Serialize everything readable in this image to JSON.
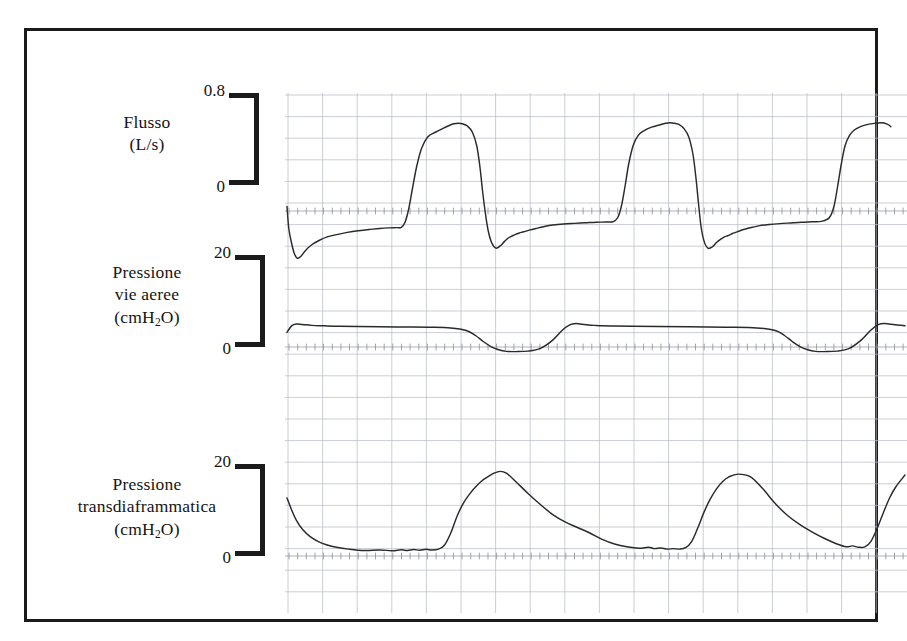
{
  "figure": {
    "border_color": "#1b1b1b",
    "grid_color": "#b9bdc9",
    "trace_color": "#2a2a2a"
  },
  "panels": [
    {
      "id": "flow",
      "label_lines": [
        "Flusso",
        "(L/s)"
      ],
      "unit": "L/s",
      "scale_top": "0.8",
      "scale_bottom": "0"
    },
    {
      "id": "airway-pressure",
      "label_lines": [
        "Pressione",
        "vie aeree",
        "(cmH2O)"
      ],
      "unit": "cmH2O",
      "scale_top": "20",
      "scale_bottom": "0"
    },
    {
      "id": "transdiaphragmatic-pressure",
      "label_lines": [
        "Pressione",
        "transdiaframmatica",
        "(cmH2O)"
      ],
      "unit": "cmH2O",
      "scale_top": "20",
      "scale_bottom": "0"
    }
  ],
  "chart_data": {
    "type": "line",
    "title": "",
    "xlabel": "",
    "grid": true,
    "legend": false,
    "n_breaths": 4,
    "panels": [
      {
        "name": "Flusso",
        "ylabel": "Flusso (L/s)",
        "yticks": [
          0,
          0.8
        ],
        "ylim": [
          -0.55,
          1.0
        ],
        "zero_y": 0,
        "series": [
          {
            "name": "Flusso",
            "x": [
              0,
              0.6,
              1.6,
              2.4,
              3.4,
              4.6,
              6.0,
              8.0,
              10.5,
              13.0,
              16.0,
              19.5,
              23.0,
              26.5,
              30.0,
              33.0,
              35.5,
              37.0,
              38.2,
              39.4,
              40.6,
              42.0,
              43.6,
              45.6,
              48.0,
              50.5,
              52.5,
              54.0,
              55.4,
              56.8,
              58.4,
              60.0,
              61.4,
              62.4,
              63.2,
              64.0,
              65.0,
              66.2,
              67.6,
              69.0,
              70.4,
              71.6,
              72.6,
              73.4,
              74.2,
              75.2,
              76.6,
              78.4,
              80.6,
              83.0,
              86.0,
              89.5,
              93.0,
              96.5,
              100.0,
              103.0,
              105.5,
              107.0,
              108.2,
              109.4,
              110.6,
              112.0,
              113.6,
              115.6,
              118.0,
              120.5,
              122.5,
              124.0,
              125.4,
              126.8,
              128.4,
              130.0,
              131.4,
              132.4,
              133.2,
              134.0,
              135.0,
              136.2,
              137.6,
              139.0,
              140.4,
              141.6,
              142.6,
              143.4,
              144.2,
              145.2,
              146.6,
              148.4,
              150.6,
              153.0,
              156.0,
              159.5,
              163.0,
              166.5,
              170.0,
              173.0,
              175.5,
              177.0,
              178.2,
              179.4,
              180.6,
              182.0,
              183.6,
              185.6,
              188.0,
              190.5,
              192.5,
              194.0,
              195.4,
              196.8,
              198.4,
              200.0
            ],
            "y": [
              0.04,
              -0.16,
              -0.3,
              -0.38,
              -0.42,
              -0.4,
              -0.35,
              -0.3,
              -0.26,
              -0.23,
              -0.21,
              -0.19,
              -0.175,
              -0.165,
              -0.155,
              -0.15,
              -0.148,
              -0.145,
              -0.1,
              0.02,
              0.2,
              0.4,
              0.56,
              0.66,
              0.7,
              0.735,
              0.76,
              0.775,
              0.78,
              0.775,
              0.755,
              0.7,
              0.58,
              0.4,
              0.2,
              0.02,
              -0.16,
              -0.28,
              -0.33,
              -0.31,
              -0.27,
              -0.24,
              -0.225,
              -0.215,
              -0.205,
              -0.195,
              -0.185,
              -0.17,
              -0.155,
              -0.14,
              -0.125,
              -0.115,
              -0.11,
              -0.105,
              -0.1,
              -0.098,
              -0.095,
              -0.06,
              0.04,
              0.22,
              0.42,
              0.58,
              0.67,
              0.715,
              0.745,
              0.765,
              0.78,
              0.785,
              0.78,
              0.77,
              0.735,
              0.66,
              0.5,
              0.28,
              0.06,
              -0.14,
              -0.27,
              -0.33,
              -0.32,
              -0.28,
              -0.25,
              -0.23,
              -0.22,
              -0.21,
              -0.2,
              -0.19,
              -0.175,
              -0.16,
              -0.145,
              -0.13,
              -0.12,
              -0.112,
              -0.106,
              -0.1,
              -0.096,
              -0.092,
              -0.06,
              0.04,
              0.22,
              0.42,
              0.58,
              0.67,
              0.72,
              0.75,
              0.77,
              0.78,
              0.785,
              0.775,
              0.75,
              0.68
            ]
          }
        ]
      },
      {
        "name": "Pressione vie aeree",
        "ylabel": "Pressione vie aeree (cmH2O)",
        "yticks": [
          0,
          20
        ],
        "ylim": [
          -8,
          22
        ],
        "zero_y": 0,
        "series": [
          {
            "name": "Paw",
            "x": [
              0,
              1.5,
              3,
              5,
              8,
              12,
              17,
              23,
              30,
              38,
              46,
              53,
              58,
              61,
              63.5,
              66,
              68.5,
              71,
              74,
              78,
              82,
              86,
              89,
              91.5,
              93.5,
              95.5,
              97.5,
              99.5,
              102,
              106,
              112,
              120,
              130,
              142,
              152,
              158,
              161,
              163.5,
              166,
              168.5,
              171,
              174,
              178,
              182,
              186,
              189,
              191.5,
              193.5,
              195.5,
              197.5,
              200
            ],
            "y": [
              3.2,
              4.6,
              5.0,
              4.9,
              4.7,
              4.6,
              4.5,
              4.45,
              4.4,
              4.35,
              4.3,
              4.15,
              3.6,
              2.5,
              1.2,
              0.1,
              -0.6,
              -0.95,
              -1.0,
              -0.9,
              -0.3,
              1.5,
              3.6,
              4.8,
              5.1,
              4.95,
              4.8,
              4.7,
              4.6,
              4.55,
              4.5,
              4.45,
              4.4,
              4.3,
              4.15,
              3.6,
              2.5,
              1.2,
              0.1,
              -0.6,
              -0.95,
              -1.0,
              -0.9,
              -0.3,
              1.6,
              3.7,
              4.9,
              5.1,
              4.95,
              4.8,
              4.6
            ]
          }
        ]
      },
      {
        "name": "Pressione transdiaframmatica",
        "ylabel": "Pressione transdiaframmatica (cmH2O)",
        "yticks": [
          0,
          20
        ],
        "ylim": [
          -5,
          22
        ],
        "zero_y": 0,
        "series": [
          {
            "name": "Pdi",
            "x": [
              0,
              1.5,
              3,
              5,
              7.5,
              10,
              13,
              16,
              20,
              25,
              30,
              34,
              37,
              39,
              41,
              43,
              45,
              47,
              49,
              51,
              53,
              55,
              57,
              59,
              61,
              63,
              65,
              67,
              69,
              71,
              74,
              78,
              82,
              86,
              90,
              94,
              98,
              102,
              106,
              110,
              114,
              117,
              119,
              121,
              123,
              125,
              127,
              129,
              131,
              133,
              135,
              137,
              139,
              141,
              143,
              146,
              150,
              154,
              158,
              162,
              166,
              170,
              174,
              178,
              181,
              183,
              185,
              187,
              189,
              191,
              193,
              195,
              197,
              200
            ],
            "y": [
              12.6,
              10.0,
              7.8,
              5.8,
              4.2,
              3.2,
              2.4,
              1.9,
              1.5,
              1.2,
              1.3,
              1.15,
              1.35,
              1.2,
              1.4,
              1.25,
              1.45,
              1.3,
              1.5,
              2.4,
              5.0,
              8.6,
              11.4,
              13.4,
              15.0,
              16.3,
              17.2,
              18.0,
              18.4,
              18.0,
              16.2,
              13.6,
              11.2,
              9.0,
              7.4,
              6.2,
              5.0,
              3.6,
              2.6,
              2.0,
              1.7,
              1.9,
              1.6,
              1.75,
              1.5,
              1.6,
              1.5,
              1.8,
              3.2,
              6.2,
              9.6,
              12.4,
              14.6,
              16.2,
              17.2,
              17.8,
              17.2,
              14.6,
              11.4,
              8.8,
              6.8,
              5.2,
              3.8,
              2.6,
              2.0,
              2.2,
              1.9,
              2.0,
              3.2,
              6.0,
              9.4,
              12.6,
              15.0,
              17.6
            ]
          }
        ]
      }
    ]
  }
}
